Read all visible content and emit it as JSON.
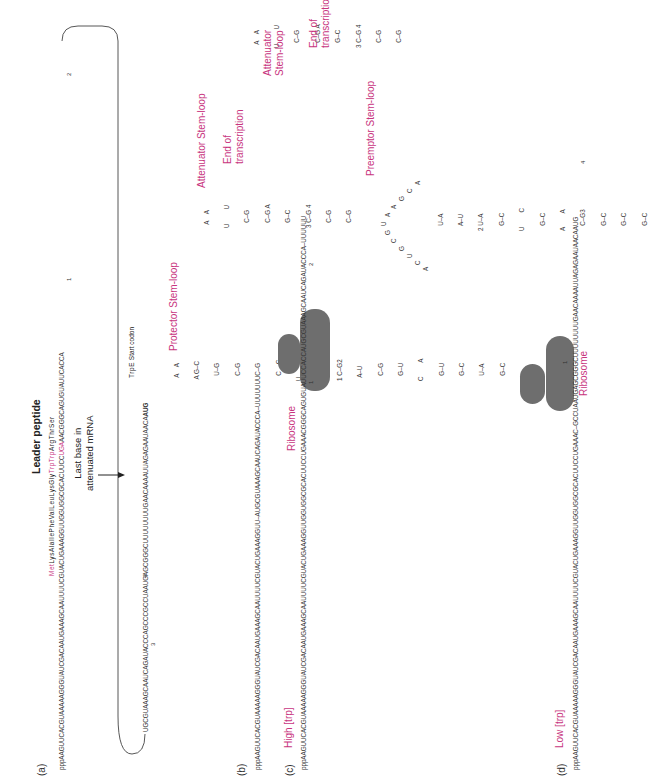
{
  "figure": {
    "panels": {
      "a": {
        "label": "(a)",
        "title": "Leader peptide",
        "peptide": {
          "met": "Met",
          "middle": "LysAlaIlePheValLeuLysGly",
          "trptrp": "TrpTrp",
          "end": "ArgThrSer"
        },
        "seq_top_1": "pppAAGUUCACGUAAAAAGGGUAUCGACA",
        "seq_top_2": "AUGAAAGCAAUUUUCGUACUGAAAGGUUGGUGGCGCACUUCC",
        "seq_top_stop": "UGA",
        "seq_top_3": "AACGGGCAGUGUAUUCACCA",
        "seq_bottom": "UGCGUAAAGCAAUCAGAUACCCAGCCCGCCUAAUGAGCGGGCUUUUUUUUGAACAAAAUUAGAGAAUAACA",
        "seq_bottom_start": "AUG",
        "region_numbers": [
          "1",
          "2",
          "3",
          "4"
        ],
        "last_base_note": [
          "Last base in",
          "attenuated mRNA"
        ],
        "trpE_label": "TrpE",
        "start_codon_label": "Start codon"
      },
      "b": {
        "label": "(b)",
        "sequence_1": "pppAAGUUCACGUAAAAAGGGUAUCGACAAUGAAAGCAAUUUUCGUACUGAAAGGUU",
        "sequence_2": "AUGCGUAAAGCAAUCAGAUACCCA",
        "sequence_tail": "UUUUUUU",
        "protector_label": "Protector Stem-loop",
        "attenuator_label": "Attenuator Stem-loop",
        "end_label": [
          "End of",
          "transcription"
        ],
        "protector_stem": [
          "  A    A",
          " A G–C",
          "   U–G",
          "   C–G",
          "   C–G",
          "   C    C",
          "U",
          "   U–A",
          "1 C–G2",
          "  A–U",
          "   C–G",
          "   G–U",
          "C        A",
          "   G–U",
          "   G–C",
          "   U–A",
          "   G–C",
          "   G–C"
        ],
        "attenuator_stem": [
          "  A    A",
          "U        U",
          "   C–G",
          "   C–G A",
          "   G–C",
          "3 C–G 4",
          "   C–G",
          "   C–G",
          "   G–C"
        ]
      },
      "c": {
        "label": "(c)",
        "condition": "High [trp]",
        "ribosome_label": "Ribosome",
        "sequence": "pppAAGUUCACGUAAAAAGGGUAUCGACAAUGAAAGCAAUUUUCGUACUGAAAGGUUGGUGGCGCACUUCCUGAAACGGGCAGUGUAUUCCACCAUGCGUAAAGCAAUCAGAUACCCA",
        "tail": "UUUUUU",
        "region_numbers": [
          "1",
          "2"
        ],
        "attenuator_label": [
          "Attenuator",
          "Stem-loop"
        ],
        "end_label": [
          "End of",
          "transcription"
        ],
        "stem": [
          "  A    A",
          "U        U",
          "   C–G",
          "   C–G A",
          "   G–C",
          "3 C–G 4",
          "   C–G",
          "   C–G",
          "   G–C"
        ]
      },
      "d": {
        "label": "(d)",
        "condition": "Low [trp]",
        "ribosome_label": "Ribosome",
        "sequence_1": "pppAAGUUCACGUAAAAAGGGUAUCGACAAUGAAAGCAAUUUUCGUACUGAAAGGUUGGUGGCGCACUUCCUGAAAC",
        "sequence_2": "GCCUAAUGAGCGGGCUUUUUUUUGAACAAAAUUAGAGAAUAACAAUG",
        "region_numbers": [
          "1",
          "4"
        ],
        "preemptor_label": "Preemptor Stem-loop",
        "loop_letters": "ACCUGCGUAAAGCAUCAGCACUU",
        "stem": [
          "   U–A",
          "   A–U",
          "2 U–A",
          "   G–C",
          "U        C",
          "   G–C",
          "A        A",
          "   C–G3",
          "   G–C",
          "   G–C",
          "   G–C"
        ]
      }
    },
    "colors": {
      "accent": "#c8347e",
      "text": "#333333",
      "ribosome": "#6e6e6e"
    }
  }
}
